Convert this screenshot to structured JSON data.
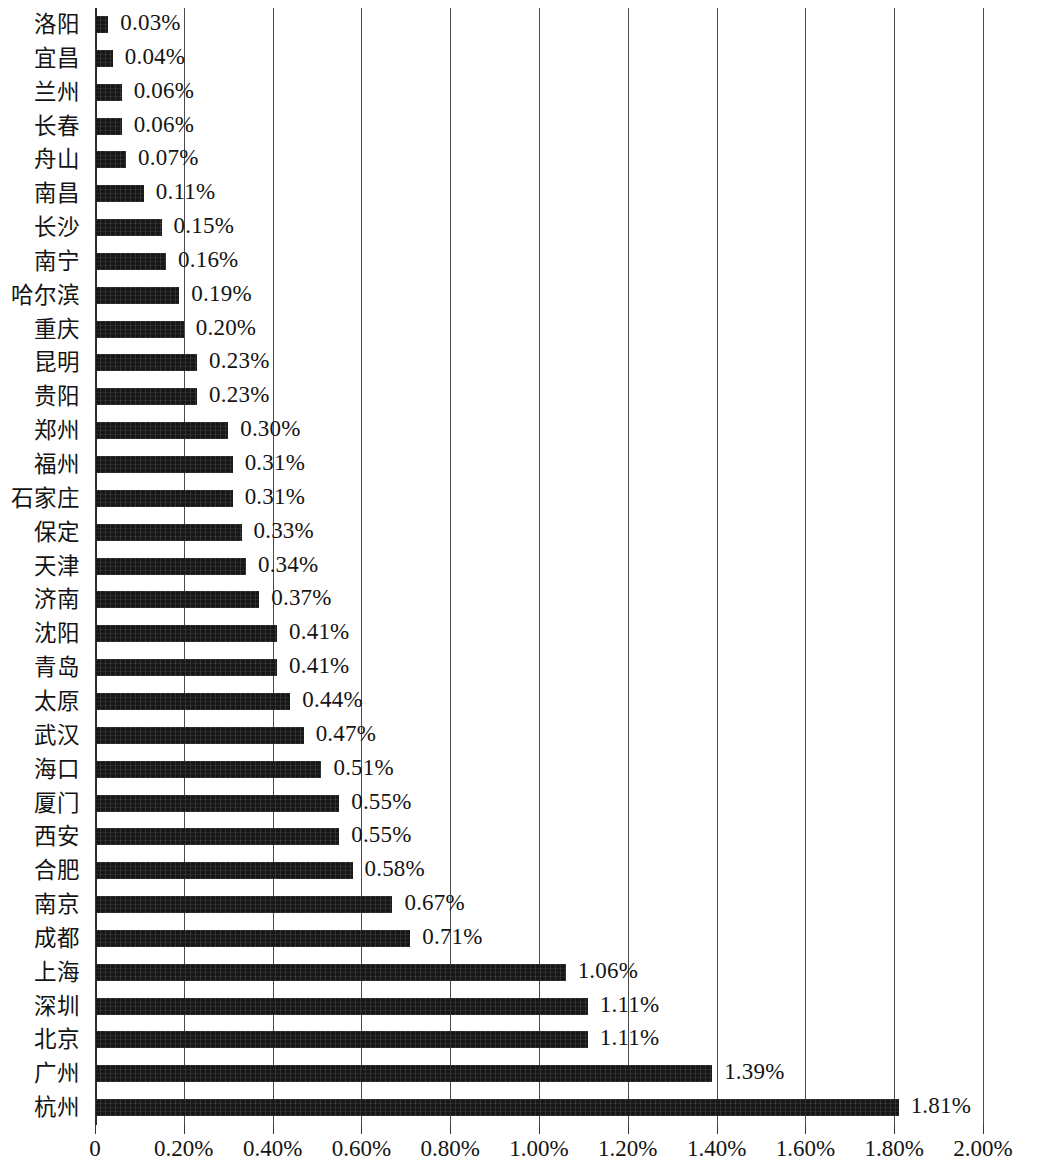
{
  "chart_data": {
    "type": "bar",
    "orientation": "horizontal",
    "title": "",
    "subtitle": "",
    "xlabel": "",
    "ylabel": "",
    "xlim": [
      0,
      2.0
    ],
    "grid": true,
    "legend": null,
    "value_suffix": "%",
    "x_tick_labels": [
      "0",
      "0.20%",
      "0.40%",
      "0.60%",
      "0.80%",
      "1.00%",
      "1.20%",
      "1.40%",
      "1.60%",
      "1.80%",
      "2.00%"
    ],
    "x_tick_values": [
      0,
      0.2,
      0.4,
      0.6,
      0.8,
      1.0,
      1.2,
      1.4,
      1.6,
      1.8,
      2.0
    ],
    "bar_color": "#171717",
    "categories": [
      "洛阳",
      "宜昌",
      "兰州",
      "长春",
      "舟山",
      "南昌",
      "长沙",
      "南宁",
      "哈尔滨",
      "重庆",
      "昆明",
      "贵阳",
      "郑州",
      "福州",
      "石家庄",
      "保定",
      "天津",
      "济南",
      "沈阳",
      "青岛",
      "太原",
      "武汉",
      "海口",
      "厦门",
      "西安",
      "合肥",
      "南京",
      "成都",
      "上海",
      "深圳",
      "北京",
      "广州",
      "杭州"
    ],
    "values": [
      0.03,
      0.04,
      0.06,
      0.06,
      0.07,
      0.11,
      0.15,
      0.16,
      0.19,
      0.2,
      0.23,
      0.23,
      0.3,
      0.31,
      0.31,
      0.33,
      0.34,
      0.37,
      0.41,
      0.41,
      0.44,
      0.47,
      0.51,
      0.55,
      0.55,
      0.58,
      0.67,
      0.71,
      1.06,
      1.11,
      1.11,
      1.39,
      1.81
    ],
    "value_labels": [
      "0.03%",
      "0.04%",
      "0.06%",
      "0.06%",
      "0.07%",
      "0.11%",
      "0.15%",
      "0.16%",
      "0.19%",
      "0.20%",
      "0.23%",
      "0.23%",
      "0.30%",
      "0.31%",
      "0.31%",
      "0.33%",
      "0.34%",
      "0.37%",
      "0.41%",
      "0.41%",
      "0.44%",
      "0.47%",
      "0.51%",
      "0.55%",
      "0.55%",
      "0.58%",
      "0.67%",
      "0.71%",
      "1.06%",
      "1.11%",
      "1.11%",
      "1.39%",
      "1.81%"
    ]
  }
}
